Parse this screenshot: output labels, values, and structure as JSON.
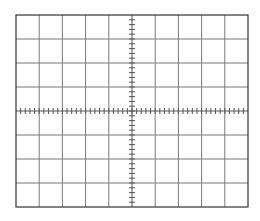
{
  "graticule": {
    "type": "oscilloscope-graticule",
    "origin": {
      "x": 16,
      "y": 15
    },
    "width": 232,
    "height": 192,
    "major_divisions_x": 10,
    "major_divisions_y": 8,
    "minor_ticks_per_division": 5,
    "tick_half_length": 3,
    "colors": {
      "background": "#ffffff",
      "border": "#333333",
      "grid_line": "#7a7a7a",
      "axis": "#555555",
      "tick": "#555555"
    }
  }
}
